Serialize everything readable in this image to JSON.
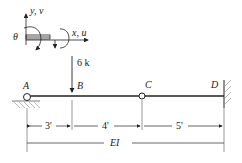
{
  "diagram": {
    "type": "beam-structure",
    "coord_system": {
      "y_label": "y, v",
      "x_label": "x, u",
      "rotation_label": "θ"
    },
    "load": {
      "label": "6 k",
      "node": "B",
      "direction": "down"
    },
    "nodes": [
      {
        "id": "A",
        "label": "A",
        "support": "pin"
      },
      {
        "id": "B",
        "label": "B",
        "support": "none"
      },
      {
        "id": "C",
        "label": "C",
        "support": "internal-hinge"
      },
      {
        "id": "D",
        "label": "D",
        "support": "fixed"
      }
    ],
    "spans": [
      {
        "from": "A",
        "to": "B",
        "length": "3'"
      },
      {
        "from": "B",
        "to": "C",
        "length": "4'"
      },
      {
        "from": "C",
        "to": "D",
        "length": "5'"
      }
    ],
    "stiffness_label": "EI",
    "colors": {
      "line": "#222222",
      "background": "#ffffff"
    }
  }
}
